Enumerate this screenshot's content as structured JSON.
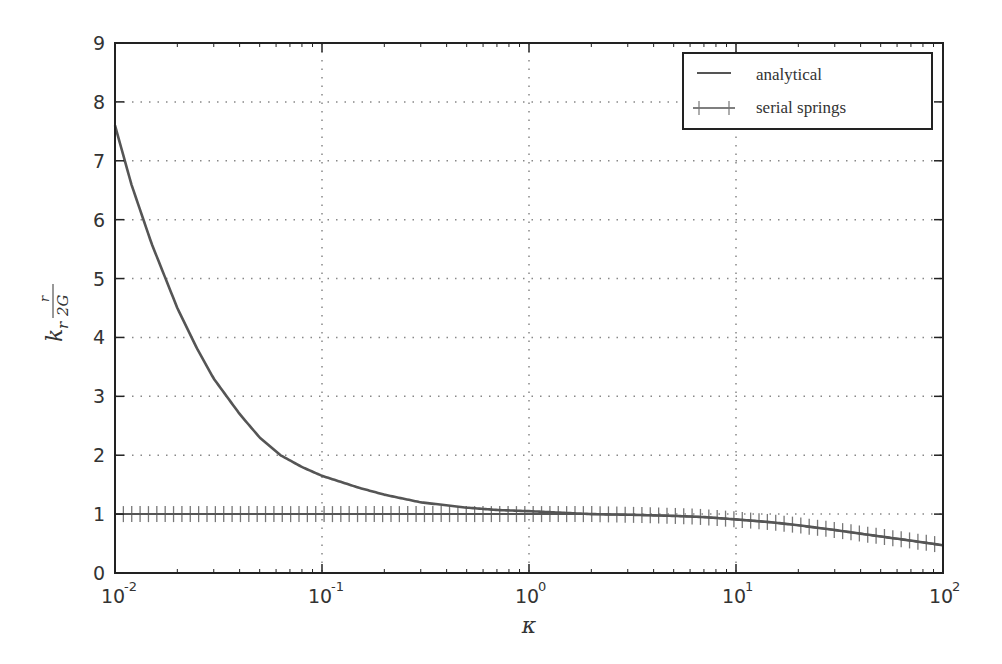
{
  "chart_data": {
    "type": "line",
    "title": "",
    "xlabel": "κ",
    "ylabel": "k_r r/(2G)",
    "ylabel_display": {
      "base": "k",
      "sub": "r",
      "num": "r",
      "den": "2G"
    },
    "xscale": "log",
    "xlim": [
      0.01,
      100
    ],
    "ylim": [
      0,
      9
    ],
    "grid": true,
    "legend_position": "upper right",
    "x_ticks": [
      {
        "base": "10",
        "exp": "-2",
        "value": 0.01
      },
      {
        "base": "10",
        "exp": "-1",
        "value": 0.1
      },
      {
        "base": "10",
        "exp": "0",
        "value": 1
      },
      {
        "base": "10",
        "exp": "1",
        "value": 10
      },
      {
        "base": "10",
        "exp": "2",
        "value": 100
      }
    ],
    "y_ticks": [
      "0",
      "1",
      "2",
      "3",
      "4",
      "5",
      "6",
      "7",
      "8",
      "9"
    ],
    "series": [
      {
        "name": "analytical",
        "style": "solid line",
        "x": [
          0.01,
          0.012,
          0.015,
          0.02,
          0.025,
          0.03,
          0.04,
          0.05,
          0.063,
          0.08,
          0.1,
          0.15,
          0.2,
          0.3,
          0.5,
          0.7,
          1,
          1.5,
          2,
          3,
          5,
          7,
          10,
          15,
          20,
          30,
          50,
          70,
          100
        ],
        "values": [
          7.6,
          6.6,
          5.6,
          4.5,
          3.8,
          3.3,
          2.7,
          2.3,
          2.0,
          1.8,
          1.65,
          1.45,
          1.33,
          1.2,
          1.11,
          1.07,
          1.05,
          1.02,
          1.0,
          0.99,
          0.97,
          0.95,
          0.91,
          0.86,
          0.81,
          0.73,
          0.62,
          0.55,
          0.47
        ]
      },
      {
        "name": "serial springs",
        "style": "line with + markers",
        "x": [
          0.01,
          0.03,
          0.1,
          0.3,
          1,
          2,
          3,
          5,
          7,
          10,
          15,
          20,
          30,
          50,
          70,
          100
        ],
        "values": [
          1.0,
          1.0,
          1.0,
          1.0,
          1.0,
          1.0,
          0.99,
          0.97,
          0.95,
          0.91,
          0.86,
          0.81,
          0.73,
          0.62,
          0.55,
          0.47
        ],
        "marker_count": 100
      }
    ]
  },
  "legend": {
    "items": [
      {
        "label": "analytical"
      },
      {
        "label": "serial springs"
      }
    ]
  },
  "colors": {
    "line": "#555555",
    "axis": "#222222",
    "grid": "#888888",
    "marker": "#777777"
  }
}
